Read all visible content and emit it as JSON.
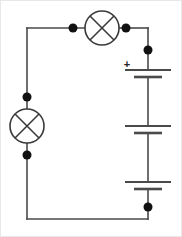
{
  "figure": {
    "width": 182,
    "height": 237,
    "background_color": "#ffffff",
    "wire_color": "#4a4a4a",
    "symbol_color": "#3a3a3a",
    "dot_color": "#111111",
    "border_color": "#e8e8e8"
  },
  "circuit": {
    "loop": {
      "left_x": 27,
      "top_y": 28,
      "right_x": 148,
      "bottom_y": 219
    },
    "lamps": [
      {
        "name": "top-lamp",
        "symbol": "lamp-cross-circle",
        "cx": 102,
        "cy": 28,
        "r": 17,
        "orientation": "horizontal"
      },
      {
        "name": "left-lamp",
        "symbol": "lamp-cross-circle",
        "cx": 27,
        "cy": 126,
        "r": 17,
        "orientation": "vertical"
      }
    ],
    "battery": {
      "name": "battery-stack",
      "cell_count": 3,
      "polarity_label": "+",
      "polarity_label_x": 127,
      "polarity_label_y": 65,
      "axis_x": 148,
      "plate_long_half_width": 23,
      "plate_short_half_width": 14,
      "cells": [
        {
          "name": "battery-cell-1",
          "long_plate_y": 70,
          "short_plate_y": 77
        },
        {
          "name": "battery-cell-2",
          "long_plate_y": 126,
          "short_plate_y": 133
        },
        {
          "name": "battery-cell-3",
          "long_plate_y": 182,
          "short_plate_y": 189
        }
      ]
    },
    "junction_dots": [
      {
        "name": "junction-dot-top-left-of-lamp",
        "cx": 73,
        "cy": 28,
        "r": 4.5
      },
      {
        "name": "junction-dot-top-right-of-lamp",
        "cx": 126,
        "cy": 28,
        "r": 4.5
      },
      {
        "name": "junction-dot-right-upper",
        "cx": 148,
        "cy": 50,
        "r": 4.5
      },
      {
        "name": "junction-dot-left-above-lamp",
        "cx": 27,
        "cy": 97,
        "r": 4.5
      },
      {
        "name": "junction-dot-left-below-lamp",
        "cx": 27,
        "cy": 155,
        "r": 4.5
      },
      {
        "name": "junction-dot-right-lower",
        "cx": 148,
        "cy": 207,
        "r": 4.5
      }
    ]
  }
}
